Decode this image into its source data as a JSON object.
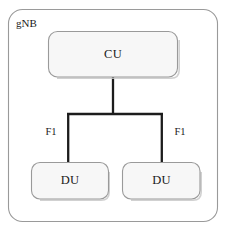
{
  "diagram": {
    "title": "gNB",
    "frame": {
      "label": "gNB",
      "name": "gnb-frame"
    },
    "nodes": [
      {
        "id": "cu",
        "label": "CU",
        "role": "central-unit"
      },
      {
        "id": "du_left",
        "label": "DU",
        "role": "distributed-unit"
      },
      {
        "id": "du_right",
        "label": "DU",
        "role": "distributed-unit"
      }
    ],
    "links": [
      {
        "id": "f1_left",
        "label": "F1",
        "from": "cu",
        "to": "du_left"
      },
      {
        "id": "f1_right",
        "label": "F1",
        "from": "cu",
        "to": "du_right"
      }
    ],
    "colors": {
      "box_fill": "#f7f7f7",
      "box_border": "#9a9a9a",
      "frame_fill": "#ffffff",
      "frame_border": "#9a9a9a",
      "connector": "#1c1c1c",
      "text": "#1a1a1a",
      "background": "#ffffff"
    }
  }
}
